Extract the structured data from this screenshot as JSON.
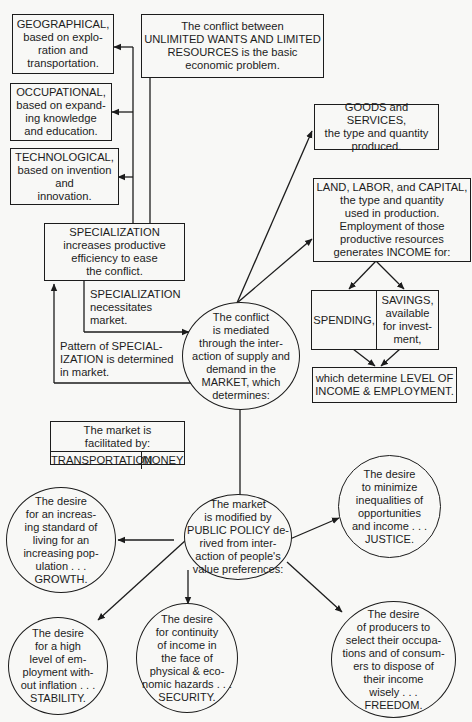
{
  "diagram": {
    "core_problem": "The conflict between\nUNLIMITED WANTS AND LIMITED\nRESOURCES is the basic\neconomic problem.",
    "specialization_types": [
      {
        "text": "GEOGRAPHICAL,\nbased on explo-\nration and\ntransportation."
      },
      {
        "text": "OCCUPATIONAL,\nbased on expand-\ning knowledge\nand education."
      },
      {
        "text": "TECHNOLOGICAL,\nbased on invention\nand\ninnovation."
      }
    ],
    "specialization": "SPECIALIZATION\nincreases productive\nefficiency to ease\nthe conflict.",
    "specialization_necessitates": "SPECIALIZATION\nnecessitates\nmarket.",
    "pattern_label": "Pattern of SPECIAL-\nIZATION is determined\nin market.",
    "market": "The conflict\nis mediated\nthrough the inter-\naction of supply and\ndemand in the\nMARKET, which\ndetermines:",
    "goods_services": "GOODS and SERVICES,\nthe type and quantity\nproduced.",
    "land_labor_capital": "LAND, LABOR, and CAPITAL,\nthe type and quantity\nused in production.\nEmployment of those\nproductive resources\ngenerates INCOME for:",
    "spending": "SPENDING,",
    "savings": "SAVINGS,\navailable\nfor invest-\nment,",
    "income_employment": "which determine LEVEL OF\nINCOME & EMPLOYMENT.",
    "facilitation": {
      "header": "The market is\nfacilitated by:",
      "items": [
        "TRANSPORTATION",
        "MONEY"
      ]
    },
    "public_policy": "The market\nis modified by\nPUBLIC POLICY de-\nrived from inter-\naction of people's\nvalue preferences:",
    "goals": {
      "growth": "The desire\nfor an increas-\ning standard of\nliving for an\nincreasing pop-\nulation . . .\nGROWTH.",
      "justice": "The desire\nto minimize\ninequalities of\nopportunities\nand income . . .\nJUSTICE.",
      "stability": "The desire\nfor a high\nlevel of em-\nployment with-\nout inflation . . .\nSTABILITY.",
      "security": "The desire\nfor continuity\nof income in\nthe face of\nphysical & eco-\nnomic hazards . . .\nSECURITY.",
      "freedom": "The desire\nof producers to\nselect their occupa-\ntions and of consum-\ners to dispose of\ntheir income\nwisely . . .\nFREEDOM."
    },
    "colors": {
      "ink": "#1c1c1c",
      "paper": "#f8f8f6"
    }
  }
}
